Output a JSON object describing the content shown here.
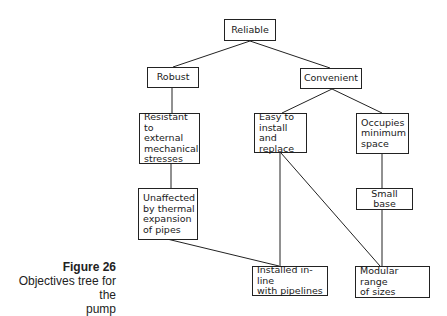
{
  "diagram": {
    "type": "objectives-tree",
    "nodes": [
      {
        "id": "reliable",
        "label": "Reliable"
      },
      {
        "id": "robust",
        "label": "Robust"
      },
      {
        "id": "convenient",
        "label": "Convenient"
      },
      {
        "id": "resistant",
        "label": "Resistant to\nexternal\nmechanical\nstresses"
      },
      {
        "id": "easy",
        "label": "Easy to\ninstall and\nreplace"
      },
      {
        "id": "occupies",
        "label": "Occupies\nminimum\nspace"
      },
      {
        "id": "unaffected",
        "label": "Unaffected\nby thermal\nexpansion\nof pipes"
      },
      {
        "id": "small_base",
        "label": "Small base"
      },
      {
        "id": "installed",
        "label": "Installed in-line\nwith pipelines"
      },
      {
        "id": "modular",
        "label": "Modular range\nof sizes"
      }
    ],
    "edges": [
      [
        "reliable",
        "robust"
      ],
      [
        "reliable",
        "convenient"
      ],
      [
        "robust",
        "resistant"
      ],
      [
        "convenient",
        "easy"
      ],
      [
        "convenient",
        "occupies"
      ],
      [
        "resistant",
        "unaffected"
      ],
      [
        "occupies",
        "small_base"
      ],
      [
        "unaffected",
        "installed"
      ],
      [
        "easy",
        "installed"
      ],
      [
        "easy",
        "modular"
      ],
      [
        "small_base",
        "modular"
      ]
    ]
  },
  "caption": {
    "figure": "Figure 26",
    "description": "Objectives tree for the\npump"
  }
}
